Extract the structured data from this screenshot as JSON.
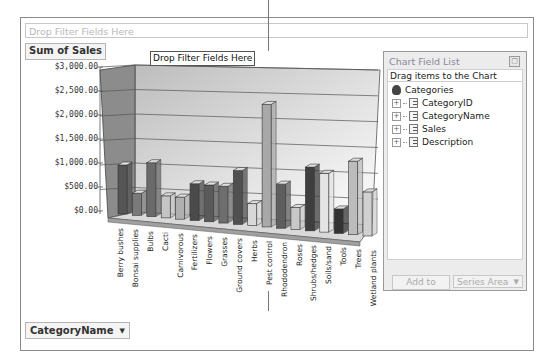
{
  "filter_area": {
    "placeholder": "Drop Filter Fields Here"
  },
  "data_field_button": {
    "label": "Sum of Sales"
  },
  "tooltip": {
    "text": "Drop Filter Fields Here"
  },
  "category_button": {
    "label": "CategoryName",
    "arrow": "▼"
  },
  "field_list": {
    "title": "Chart Field List",
    "close_glyph": "□",
    "subtitle": "Drag items to the Chart",
    "root": "Categories",
    "fields": [
      {
        "label": "CategoryID"
      },
      {
        "label": "CategoryName"
      },
      {
        "label": "Sales"
      },
      {
        "label": "Description"
      }
    ],
    "add_to_label": "Add to",
    "area_select": {
      "value": "Series Area",
      "arrow": "▼"
    }
  },
  "chart_data": {
    "type": "bar",
    "title": "",
    "xlabel": "",
    "ylabel": "Sum of Sales",
    "ylim": [
      0,
      3000
    ],
    "yticks": [
      "$0.00",
      "$500.00",
      "$1,000.00",
      "$1,500.00",
      "$2,000.00",
      "$2,500.00",
      "$3,000.00"
    ],
    "grid": true,
    "legend": "none",
    "style": "3d-column",
    "categories": [
      "Berry bushes",
      "Bonsai supplies",
      "Bulbs",
      "Cacti",
      "Carnivorous",
      "Fertilizers",
      "Flowers",
      "Grasses",
      "Ground covers",
      "Herbs",
      "Pest control",
      "Rhododendron",
      "Roses",
      "Shrubs/hedges",
      "Soils/sand",
      "Tools",
      "Trees",
      "Wetland plants"
    ],
    "values": [
      1000,
      450,
      1100,
      450,
      450,
      750,
      750,
      750,
      1100,
      450,
      2500,
      900,
      450,
      1300,
      1200,
      500,
      1500,
      900
    ],
    "bar_colors": [
      "#555555",
      "#7a7a7a",
      "#6a6a6a",
      "#c4c4c4",
      "#b0b0b0",
      "#4a4a4a",
      "#5a5a5a",
      "#6e6e6e",
      "#505050",
      "#d8d8d8",
      "#a8a8a8",
      "#5e5e5e",
      "#c8c8c8",
      "#3e3e3e",
      "#e4e4e4",
      "#333333",
      "#bcbcbc",
      "#d0d0d0"
    ]
  }
}
